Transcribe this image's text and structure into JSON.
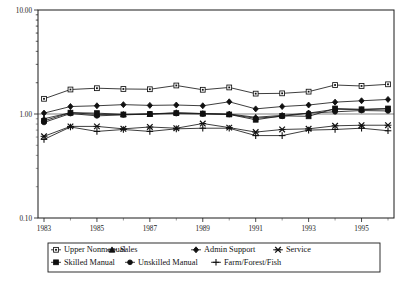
{
  "chart_data": {
    "type": "line",
    "title": "",
    "subtitle": "",
    "xlabel": "",
    "ylabel": "",
    "yscale": "log",
    "ylim": [
      0.1,
      10.0
    ],
    "ytick_labels": [
      "10.00",
      "1.00",
      "0.10"
    ],
    "ytick_values": [
      10.0,
      1.0,
      0.1
    ],
    "xlim": [
      1983,
      1996
    ],
    "xtick_labels": [
      "1983",
      "1985",
      "1987",
      "1989",
      "1991",
      "1993",
      "1995"
    ],
    "xtick_values": [
      1983,
      1985,
      1987,
      1989,
      1991,
      1993,
      1995
    ],
    "grid": false,
    "reference_line": 1.0,
    "legend_position": "bottom",
    "x": [
      1983,
      1984,
      1985,
      1986,
      1987,
      1988,
      1989,
      1990,
      1991,
      1992,
      1993,
      1994,
      1995,
      1996
    ],
    "series": [
      {
        "name": "Upper Nonmanual",
        "marker": "open-square",
        "values": [
          1.4,
          1.72,
          1.77,
          1.74,
          1.73,
          1.88,
          1.71,
          1.8,
          1.57,
          1.58,
          1.64,
          1.9,
          1.86,
          1.93
        ]
      },
      {
        "name": "Sales",
        "marker": "solid-triangle",
        "values": [
          0.9,
          1.03,
          0.99,
          0.99,
          1.0,
          1.03,
          1.01,
          1.0,
          0.93,
          0.97,
          1.02,
          1.11,
          1.1,
          1.12
        ]
      },
      {
        "name": "Admin Support",
        "marker": "solid-diamond",
        "values": [
          1.02,
          1.18,
          1.2,
          1.23,
          1.21,
          1.22,
          1.2,
          1.31,
          1.12,
          1.18,
          1.22,
          1.3,
          1.34,
          1.38
        ]
      },
      {
        "name": "Service",
        "marker": "cross-x",
        "values": [
          0.61,
          0.76,
          0.76,
          0.72,
          0.75,
          0.73,
          0.81,
          0.74,
          0.67,
          0.71,
          0.72,
          0.77,
          0.78,
          0.78
        ]
      },
      {
        "name": "Skilled Manual",
        "marker": "solid-square",
        "values": [
          0.86,
          1.03,
          1.02,
          0.99,
          1.0,
          1.02,
          1.01,
          0.99,
          0.88,
          0.96,
          0.95,
          1.13,
          1.11,
          1.13
        ]
      },
      {
        "name": "Unskilled Manual",
        "marker": "solid-circle",
        "values": [
          0.83,
          1.01,
          0.96,
          0.98,
          1.0,
          1.01,
          1.0,
          0.99,
          0.91,
          0.95,
          1.02,
          1.05,
          1.08,
          1.07
        ]
      },
      {
        "name": "Farm/Forest/Fish",
        "marker": "plus",
        "values": [
          0.57,
          0.75,
          0.68,
          0.71,
          0.68,
          0.72,
          0.73,
          0.73,
          0.62,
          0.62,
          0.7,
          0.71,
          0.73,
          0.69
        ]
      }
    ]
  },
  "legend": {
    "rows": [
      [
        "Upper Nonmanual",
        "Sales",
        "Admin Support",
        "Service"
      ],
      [
        "Skilled Manual",
        "Unskilled Manual",
        "Farm/Forest/Fish"
      ]
    ]
  },
  "caption": {
    "text": ""
  }
}
